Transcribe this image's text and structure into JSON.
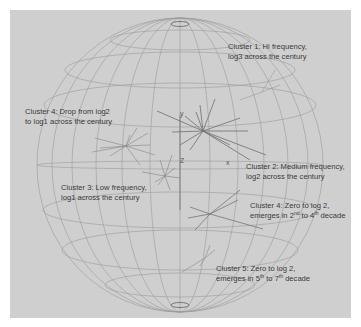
{
  "figure": {
    "type": "3d-wireframe-sphere-cluster-plot",
    "axes": {
      "x": "x",
      "y": "y",
      "z": "Z"
    },
    "colors": {
      "background": "#cfcfcf",
      "wireframe": "#9a9a9a",
      "vectors": "#6e6e6e",
      "text": "#3a3a3a"
    },
    "annotations": [
      {
        "id": "cluster1",
        "line1": "Cluster 1:  Hi frequency,",
        "line2": "log3 across the century"
      },
      {
        "id": "cluster4a",
        "line1": "Cluster 4:  Drop from log2",
        "line2": "to log1 across the century"
      },
      {
        "id": "cluster2",
        "line1": "Cluster 2:  Medium frequency,",
        "line2": "log2 across the century"
      },
      {
        "id": "cluster3",
        "line1": "Cluster 3:  Low frequency,",
        "line2": "log1 across the century"
      },
      {
        "id": "cluster4b",
        "line1": "Cluster 4:  Zero to log 2,",
        "line2_pre": "emerges in 2",
        "line2_sup1": "nd",
        "line2_mid": " to 4",
        "line2_sup2": "th",
        "line2_post": " decade"
      },
      {
        "id": "cluster5",
        "line1": "Cluster 5:  Zero to log 2,",
        "line2_pre": "emerges in 5",
        "line2_sup1": "th",
        "line2_mid": " to 7",
        "line2_sup2": "th",
        "line2_post": " decade"
      }
    ]
  }
}
